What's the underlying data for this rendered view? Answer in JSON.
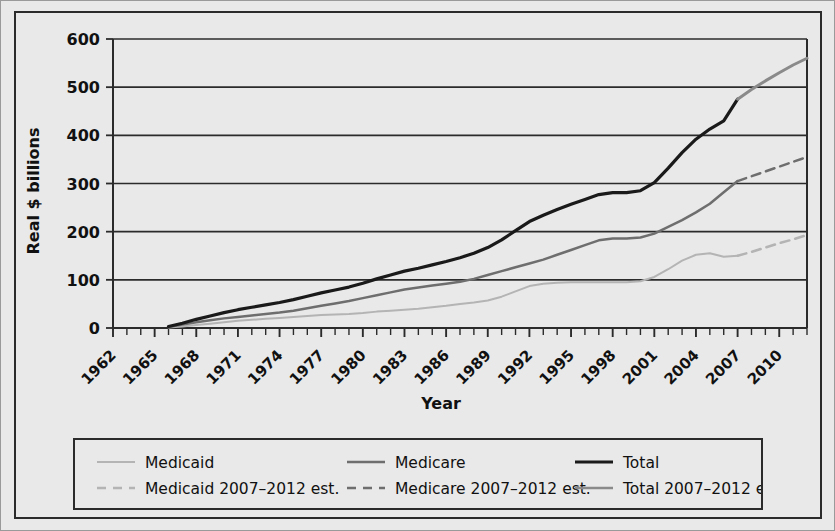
{
  "figure": {
    "background_color": "#e9e9e9",
    "border_color": "#2b2b2b"
  },
  "chart_data": {
    "type": "line",
    "title": "",
    "xlabel": "Year",
    "ylabel": "Real $ billions",
    "xlim": [
      1962,
      2012
    ],
    "ylim": [
      0,
      600
    ],
    "yticks": [
      0,
      100,
      200,
      300,
      400,
      500,
      600
    ],
    "xticks": [
      1962,
      1965,
      1968,
      1971,
      1974,
      1977,
      1980,
      1983,
      1986,
      1989,
      1992,
      1995,
      1998,
      2001,
      2004,
      2007,
      2010
    ],
    "minor_xtick_interval": 1,
    "grid": "horizontal",
    "legend_position": "below-axes",
    "tick_label_rotation": -45,
    "colors": {
      "medicaid": "#b4b4b4",
      "medicare": "#6e6e6e",
      "total": "#1a1a1a",
      "estimate_total": "#8a8a8a",
      "gridline": "#2b2b2b"
    },
    "series": [
      {
        "name": "Medicaid",
        "style": "solid",
        "color": "#b4b4b4",
        "width": 2,
        "x": [
          1966,
          1967,
          1968,
          1969,
          1970,
          1971,
          1972,
          1973,
          1974,
          1975,
          1976,
          1977,
          1978,
          1979,
          1980,
          1981,
          1982,
          1983,
          1984,
          1985,
          1986,
          1987,
          1988,
          1989,
          1990,
          1991,
          1992,
          1993,
          1994,
          1995,
          1996,
          1997,
          1998,
          1999,
          2000,
          2001,
          2002,
          2003,
          2004,
          2005,
          2006,
          2007
        ],
        "y": [
          1,
          3,
          6,
          9,
          12,
          15,
          17,
          19,
          21,
          23,
          25,
          27,
          28,
          29,
          31,
          34,
          36,
          38,
          40,
          43,
          46,
          50,
          53,
          57,
          65,
          76,
          87,
          92,
          94,
          95,
          95,
          95,
          95,
          95,
          97,
          106,
          122,
          140,
          152,
          155,
          148,
          150
        ]
      },
      {
        "name": "Medicare",
        "style": "solid",
        "color": "#6e6e6e",
        "width": 2.5,
        "x": [
          1966,
          1967,
          1968,
          1969,
          1970,
          1971,
          1972,
          1973,
          1974,
          1975,
          1976,
          1977,
          1978,
          1979,
          1980,
          1981,
          1982,
          1983,
          1984,
          1985,
          1986,
          1987,
          1988,
          1989,
          1990,
          1991,
          1992,
          1993,
          1994,
          1995,
          1996,
          1997,
          1998,
          1999,
          2000,
          2001,
          2002,
          2003,
          2004,
          2005,
          2006,
          2007
        ],
        "y": [
          2,
          7,
          12,
          16,
          20,
          23,
          26,
          29,
          32,
          36,
          41,
          46,
          51,
          56,
          62,
          68,
          74,
          80,
          84,
          88,
          92,
          96,
          102,
          110,
          118,
          126,
          134,
          142,
          152,
          162,
          172,
          182,
          186,
          186,
          188,
          196,
          210,
          224,
          240,
          258,
          282,
          305
        ]
      },
      {
        "name": "Total",
        "style": "solid",
        "color": "#1a1a1a",
        "width": 3.2,
        "x": [
          1966,
          1967,
          1968,
          1969,
          1970,
          1971,
          1972,
          1973,
          1974,
          1975,
          1976,
          1977,
          1978,
          1979,
          1980,
          1981,
          1982,
          1983,
          1984,
          1985,
          1986,
          1987,
          1988,
          1989,
          1990,
          1991,
          1992,
          1993,
          1994,
          1995,
          1996,
          1997,
          1998,
          1999,
          2000,
          2001,
          2002,
          2003,
          2004,
          2005,
          2006,
          2007
        ],
        "y": [
          3,
          10,
          18,
          25,
          32,
          38,
          43,
          48,
          53,
          59,
          66,
          73,
          79,
          85,
          93,
          102,
          110,
          118,
          124,
          131,
          138,
          146,
          155,
          167,
          183,
          202,
          221,
          234,
          246,
          257,
          267,
          277,
          281,
          281,
          285,
          302,
          332,
          364,
          392,
          413,
          430,
          475
        ]
      },
      {
        "name": "Medicaid 2007–2012 est.",
        "style": "dashed",
        "color": "#b4b4b4",
        "width": 2.5,
        "x": [
          2007,
          2008,
          2009,
          2010,
          2011,
          2012
        ],
        "y": [
          150,
          158,
          167,
          176,
          184,
          193
        ]
      },
      {
        "name": "Medicare 2007–2012 est.",
        "style": "dashed",
        "color": "#6e6e6e",
        "width": 2.5,
        "x": [
          2007,
          2008,
          2009,
          2010,
          2011,
          2012
        ],
        "y": [
          305,
          315,
          325,
          335,
          345,
          355
        ]
      },
      {
        "name": "Total 2007–2012 est.",
        "style": "solid",
        "color": "#8a8a8a",
        "width": 3,
        "x": [
          2007,
          2008,
          2009,
          2010,
          2011,
          2012
        ],
        "y": [
          475,
          495,
          513,
          530,
          546,
          560
        ]
      }
    ]
  },
  "legend": {
    "entries": [
      {
        "label": "Medicaid",
        "style": "solid",
        "color": "#b4b4b4",
        "width": 2
      },
      {
        "label": "Medicare",
        "style": "solid",
        "color": "#6e6e6e",
        "width": 2.6
      },
      {
        "label": "Total",
        "style": "solid",
        "color": "#1a1a1a",
        "width": 3.2
      },
      {
        "label": "Medicaid 2007–2012 est.",
        "style": "dashed",
        "color": "#b4b4b4",
        "width": 2.4
      },
      {
        "label": "Medicare 2007–2012 est.",
        "style": "dashed",
        "color": "#6e6e6e",
        "width": 2.4
      },
      {
        "label": "Total 2007–2012 est.",
        "style": "solid",
        "color": "#8a8a8a",
        "width": 2.6
      }
    ]
  }
}
